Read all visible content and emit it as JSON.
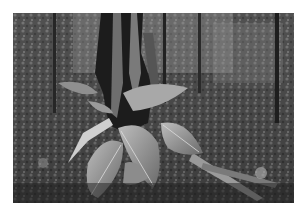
{
  "image": {
    "description": "Black-and-white photograph of a tropical forest floor: buttressed tree trunk with large broad leaves and exposed roots in the foreground, dense foliage background",
    "border_color": "#ffffff",
    "tone": "grayscale",
    "frame": {
      "left": 13,
      "top": 13,
      "width": 281,
      "height": 190
    }
  }
}
